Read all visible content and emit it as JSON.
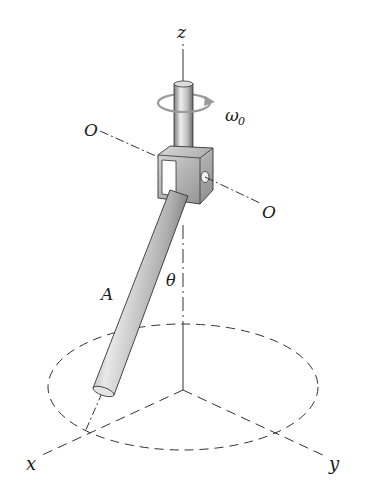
{
  "labels": {
    "z_axis": "z",
    "x_axis": "x",
    "y_axis": "y",
    "omega": "ω",
    "omega_sub": "0",
    "pivot_left": "O",
    "pivot_right": "O",
    "point_a": "A",
    "angle": "θ"
  },
  "colors": {
    "line": "#1a1a1a",
    "dash": "#333333",
    "metal_light": "#e6e6e6",
    "metal_mid": "#b5b5b5",
    "metal_dark": "#6e6e6e",
    "rotation_arrow": "#9a9a9a"
  }
}
